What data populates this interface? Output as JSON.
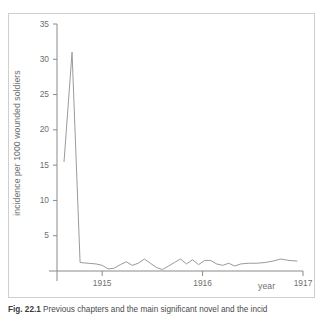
{
  "figure": {
    "caption_label": "Fig. 22.1",
    "caption_text": "Previous chapters and the main significant novel and the incid",
    "frame_color": "#cfcfcf",
    "line_color": "#9a9a9a",
    "axis_color": "#8a8a8a",
    "background": "#ffffff"
  },
  "chart_data": {
    "type": "line",
    "title": "",
    "subtitle": "",
    "xlabel": "year",
    "ylabel": "incidence per 1000 wounded soldiers",
    "xlim": [
      1914.55,
      1917.0
    ],
    "ylim": [
      0,
      35
    ],
    "yticks": [
      5,
      10,
      15,
      20,
      25,
      30,
      35
    ],
    "ytick_labels": [
      "5",
      "10",
      "15",
      "20",
      "25",
      "30",
      "35"
    ],
    "xticks": [
      1915,
      1916,
      1917
    ],
    "xtick_labels": [
      "1915",
      "1916",
      "1917"
    ],
    "grid": false,
    "legend": "none",
    "series": [
      {
        "name": "incidence per 1000 wounded soldiers",
        "x": [
          1914.62,
          1914.7,
          1914.78,
          1914.86,
          1914.94,
          1915.0,
          1915.06,
          1915.12,
          1915.18,
          1915.24,
          1915.3,
          1915.36,
          1915.42,
          1915.48,
          1915.54,
          1915.6,
          1915.66,
          1915.72,
          1915.78,
          1915.84,
          1915.9,
          1915.96,
          1916.02,
          1916.08,
          1916.14,
          1916.2,
          1916.26,
          1916.32,
          1916.38,
          1916.46,
          1916.54,
          1916.62,
          1916.7,
          1916.78,
          1916.86,
          1916.94
        ],
        "y": [
          15.5,
          31.0,
          1.2,
          1.1,
          1.0,
          0.8,
          0.3,
          0.4,
          0.9,
          1.3,
          0.8,
          1.1,
          1.7,
          1.1,
          0.5,
          0.2,
          0.7,
          1.2,
          1.7,
          1.0,
          1.6,
          0.9,
          1.5,
          1.5,
          1.0,
          0.8,
          1.1,
          0.7,
          1.0,
          1.1,
          1.1,
          1.2,
          1.4,
          1.7,
          1.5,
          1.4
        ]
      }
    ],
    "annotations": {
      "peak_value": 31.0,
      "start_value": 15.5,
      "baseline_range": [
        0.2,
        1.7
      ]
    }
  }
}
